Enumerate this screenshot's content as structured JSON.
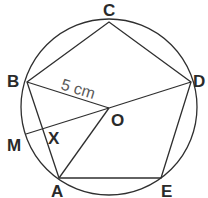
{
  "diagram": {
    "type": "geometry",
    "circle": {
      "cx": 109,
      "cy": 107,
      "r": 88
    },
    "points": {
      "A": {
        "label": "A",
        "x": 59,
        "y": 178
      },
      "B": {
        "label": "B",
        "x": 27,
        "y": 82
      },
      "C": {
        "label": "C",
        "x": 109,
        "y": 22
      },
      "D": {
        "label": "D",
        "x": 191,
        "y": 82
      },
      "E": {
        "label": "E",
        "x": 161,
        "y": 178
      },
      "O": {
        "label": "O",
        "x": 109,
        "y": 108
      },
      "M": {
        "label": "M",
        "x": 26,
        "y": 134
      },
      "X": {
        "label": "X"
      }
    },
    "measurement": {
      "segment": "BO",
      "label": "5 cm"
    },
    "colors": {
      "line": "#2f2f2f",
      "label": "#2a2a2a",
      "measurement": "#5a5a5a",
      "background": "#ffffff"
    }
  }
}
